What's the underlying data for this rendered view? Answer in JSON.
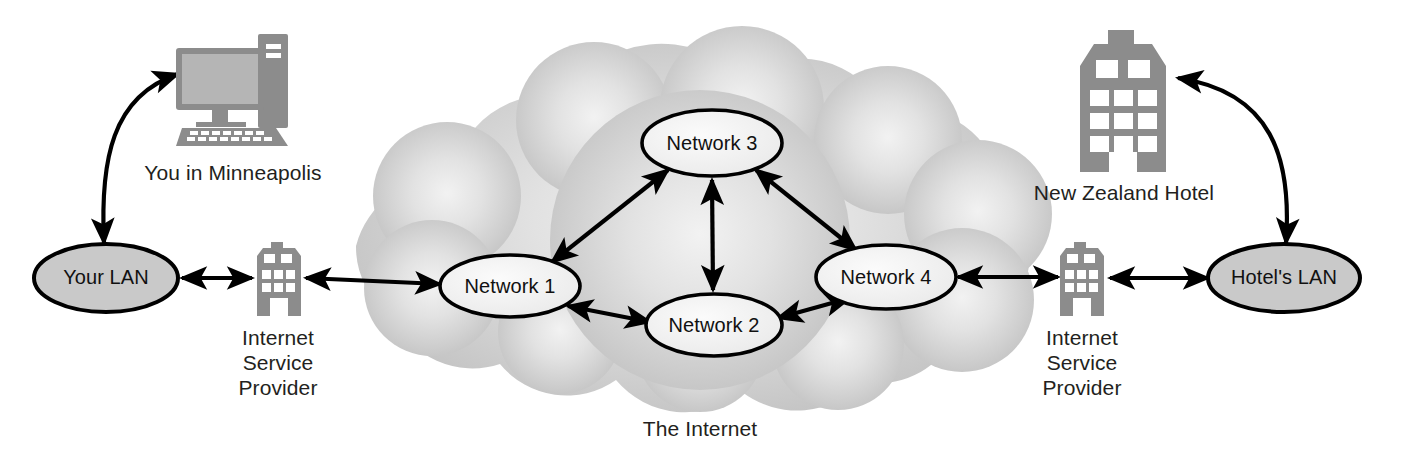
{
  "diagram": {
    "caption": "The Internet"
  },
  "colors": {
    "icon_gray": "#8c8c8c",
    "lan_fill": "#c9c9c9",
    "cloud_outer": "#c2c2c2",
    "cloud_inner": "#efefef",
    "node_fill": "#f4f4f4",
    "stroke": "#000000",
    "text": "#231f20"
  },
  "left": {
    "computer": {
      "name": "desktop-computer-icon",
      "label": "You in Minneapolis"
    },
    "lan": {
      "label": "Your LAN"
    },
    "isp": {
      "label": "Internet\nService\nProvider"
    }
  },
  "right": {
    "hotel": {
      "name": "hotel-building-icon",
      "label": "New Zealand Hotel"
    },
    "lan": {
      "label": "Hotel's LAN"
    },
    "isp": {
      "label": "Internet\nService\nProvider"
    }
  },
  "cloud": {
    "label": "The Internet",
    "nodes": [
      {
        "id": "n1",
        "label": "Network 1",
        "cx": 510,
        "cy": 286,
        "rx": 70,
        "ry": 31
      },
      {
        "id": "n2",
        "label": "Network 2",
        "cx": 714,
        "cy": 325,
        "rx": 68,
        "ry": 31
      },
      {
        "id": "n3",
        "label": "Network 3",
        "cx": 712,
        "cy": 143,
        "rx": 70,
        "ry": 33
      },
      {
        "id": "n4",
        "label": "Network 4",
        "cx": 886,
        "cy": 277,
        "rx": 70,
        "ry": 32
      }
    ],
    "links": [
      {
        "from": "n1",
        "to": "n3",
        "arrows": "both"
      },
      {
        "from": "n3",
        "to": "n2",
        "arrows": "both"
      },
      {
        "from": "n3",
        "to": "n4",
        "arrows": "both"
      },
      {
        "from": "n1",
        "to": "n2",
        "arrows": "both"
      },
      {
        "from": "n2",
        "to": "n4",
        "arrows": "both"
      }
    ]
  },
  "connections": [
    {
      "from": "your-lan",
      "to": "left-isp",
      "arrows": "both"
    },
    {
      "from": "left-isp",
      "to": "n1",
      "arrows": "both"
    },
    {
      "from": "n4",
      "to": "right-isp",
      "arrows": "both"
    },
    {
      "from": "right-isp",
      "to": "hotels-lan",
      "arrows": "both"
    },
    {
      "from": "your-lan",
      "to": "computer",
      "arrows": "both",
      "style": "curved"
    },
    {
      "from": "hotels-lan",
      "to": "hotel",
      "arrows": "both",
      "style": "curved"
    }
  ]
}
